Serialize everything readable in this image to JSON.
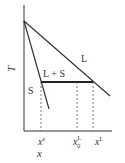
{
  "diagram": {
    "type": "phase-diagram",
    "axes": {
      "y_label": "T",
      "x_label": "x"
    },
    "regions": {
      "liquid": "L",
      "solid": "S",
      "two_phase": "L + S"
    },
    "x_ticks": {
      "solid_comp": {
        "base": "x",
        "sup": "s"
      },
      "initial_comp": {
        "base": "x",
        "sup": "L",
        "sub": "0"
      },
      "liquid_comp": {
        "base": "x",
        "sup": "L"
      }
    },
    "colors": {
      "line": "#333333",
      "background": "#ffffff"
    }
  }
}
